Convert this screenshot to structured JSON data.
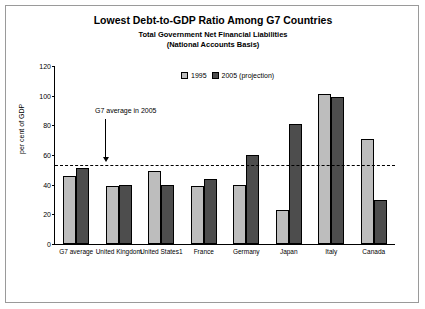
{
  "chart_data": {
    "type": "bar",
    "title": "Lowest Debt-to-GDP Ratio Among G7 Countries",
    "subtitle1": "Total Government Net Financial Liabilities",
    "subtitle2": "(National Accounts Basis)",
    "ylabel": "per cent of GDP",
    "xlabel": "",
    "ylim": [
      0,
      120
    ],
    "yticks": [
      0,
      20,
      40,
      60,
      80,
      100,
      120
    ],
    "grid": false,
    "legend_position": "top-center",
    "categories": [
      "G7 average",
      "United Kingdom",
      "United States1",
      "France",
      "Germany",
      "Japan",
      "Italy",
      "Canada"
    ],
    "series": [
      {
        "name": "1995",
        "values": [
          46,
          39,
          49,
          39,
          40,
          23,
          101,
          71
        ]
      },
      {
        "name": "2005 (projection)",
        "values": [
          51,
          40,
          40,
          44,
          60,
          81,
          99,
          30
        ]
      }
    ],
    "annotation": {
      "text": "G7 average in 2005",
      "value": 53
    },
    "colors": {
      "series_1995": "#bdbdbd",
      "series_2005": "#4d4d4d",
      "axis": "#000000",
      "background": "#ffffff",
      "frame": "#9a9a9a"
    }
  }
}
